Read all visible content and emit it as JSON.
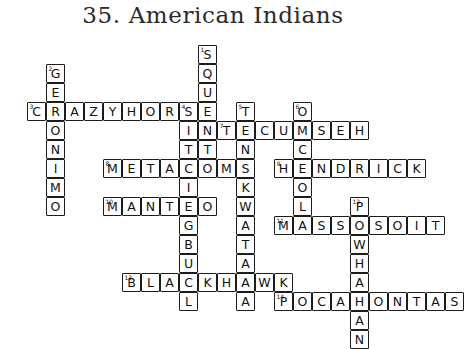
{
  "page": {
    "title": "35. American Indians",
    "background_color": "#ffffff",
    "ink_color": "#1c1c1c"
  },
  "grid": {
    "cell_size": 19,
    "origin_x": 27,
    "origin_y": 45,
    "columns": 21,
    "rows": 14
  },
  "entries": [
    {
      "number": "1",
      "answer": "SQUANTO",
      "direction": "down",
      "row": 0,
      "col": 9,
      "length": 7
    },
    {
      "number": "2",
      "answer": "GERONIMO",
      "direction": "down",
      "row": 1,
      "col": 1,
      "length": 8
    },
    {
      "number": "3",
      "answer": "CRAZYHORSE",
      "direction": "across",
      "row": 3,
      "col": 0,
      "length": 10
    },
    {
      "number": "4",
      "answer": "SITTINGBULL",
      "direction": "down",
      "row": 3,
      "col": 8,
      "length": 11
    },
    {
      "number": "5",
      "answer": "TENSKWATAWA",
      "direction": "down",
      "row": 3,
      "col": 11,
      "length": 11
    },
    {
      "number": "6",
      "answer": "OSCEOLA",
      "direction": "down",
      "row": 3,
      "col": 14,
      "length": 7
    },
    {
      "number": "7",
      "answer": "TECUMSEH",
      "direction": "across",
      "row": 4,
      "col": 10,
      "length": 8
    },
    {
      "number": "8",
      "answer": "METACOM",
      "direction": "across",
      "row": 6,
      "col": 4,
      "length": 7
    },
    {
      "number": "9",
      "answer": "HENDRICK",
      "direction": "across",
      "row": 6,
      "col": 13,
      "length": 8
    },
    {
      "number": "10",
      "answer": "MANTEO",
      "direction": "across",
      "row": 8,
      "col": 4,
      "length": 6
    },
    {
      "number": "11",
      "answer": "MASSASOIT",
      "direction": "across",
      "row": 9,
      "col": 13,
      "length": 9
    },
    {
      "number": "12",
      "answer": "POWHATAN",
      "direction": "down",
      "row": 8,
      "col": 17,
      "length": 8
    },
    {
      "number": "13",
      "answer": "BLACKHAWK",
      "direction": "across",
      "row": 12,
      "col": 5,
      "length": 9
    },
    {
      "number": "14",
      "answer": "POCAHONTAS",
      "direction": "across",
      "row": 13,
      "col": 13,
      "length": 10
    }
  ]
}
